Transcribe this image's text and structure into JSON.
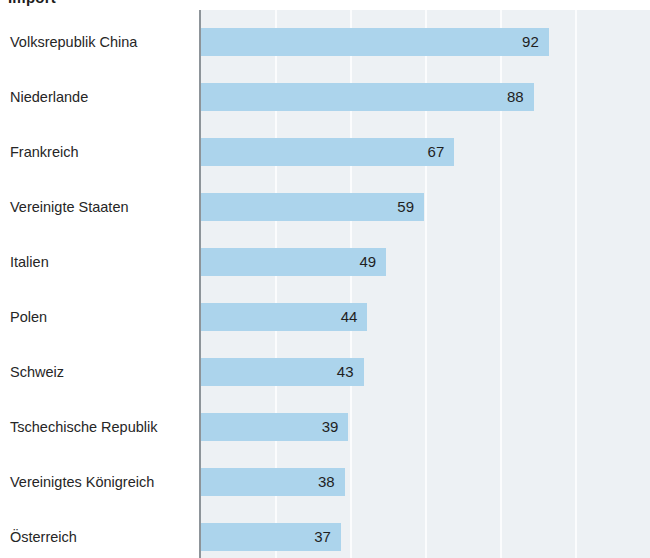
{
  "title": "Import",
  "colors": {
    "bar": "#acd4ec",
    "plot_background": "#edf1f4",
    "gridline": "#fbfcfd",
    "axis": "#8d9499",
    "label_text": "#262626",
    "value_text": "#1f1f1f",
    "page_background": "#ffffff"
  },
  "chart_data": {
    "type": "bar",
    "orientation": "horizontal",
    "title": "Import",
    "xlabel": "",
    "ylabel": "",
    "categories": [
      "Volksrepublik China",
      "Niederlande",
      "Frankreich",
      "Vereinigte Staaten",
      "Italien",
      "Polen",
      "Schweiz",
      "Tschechische Republik",
      "Vereinigtes Königreich",
      "Österreich"
    ],
    "values": [
      92,
      88,
      67,
      59,
      49,
      44,
      43,
      39,
      38,
      37
    ],
    "value_labels": [
      "92",
      "88",
      "67",
      "59",
      "49",
      "44",
      "43",
      "39",
      "38",
      "37"
    ],
    "xlim": [
      0,
      119
    ],
    "xticks": [
      20,
      40,
      60,
      80,
      100
    ],
    "grid": true,
    "grid_axis": "x",
    "legend": false,
    "data_labels": true,
    "data_label_position": "inside-end"
  },
  "layout": {
    "plot_left_px": 200,
    "plot_top_px": 10,
    "bar_origin_px": 201,
    "px_per_unit": 3.78,
    "row_pitch_px": 55,
    "first_row_top_px": 28,
    "bar_height_px": 28,
    "gridline_positions_px": [
      275,
      350,
      425,
      500,
      575
    ]
  }
}
